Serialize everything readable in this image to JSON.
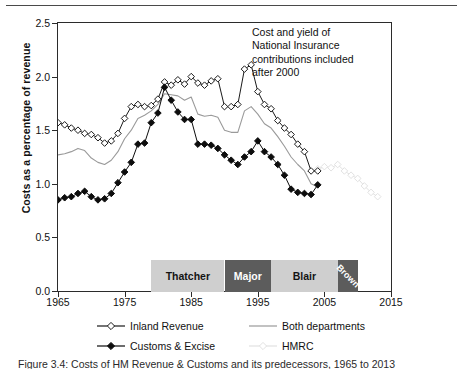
{
  "figure": {
    "caption": "Figure 3.4: Costs of HM Revenue & Customs and its predecessors, 1965 to 2013"
  },
  "annotation": {
    "lines": [
      "Cost and yield of",
      "National Insurance",
      "contributions included",
      "after 2000"
    ]
  },
  "pm_bar": {
    "segments": [
      {
        "name": "Thatcher",
        "start": 1979,
        "end": 1990,
        "style": "light"
      },
      {
        "name": "Major",
        "start": 1990,
        "end": 1997,
        "style": "dark"
      },
      {
        "name": "Blair",
        "start": 1997,
        "end": 2007,
        "style": "light"
      },
      {
        "name": "Brown",
        "start": 2007,
        "end": 2010,
        "style": "dark"
      }
    ]
  },
  "legend": {
    "entries": [
      {
        "label": "Inland Revenue",
        "marker": "open-diamond",
        "color": "#1a1a1a",
        "line": "solid"
      },
      {
        "label": "Both departments",
        "marker": "none",
        "color": "#9a9a9a",
        "line": "solid"
      },
      {
        "label": "Customs & Excise",
        "marker": "filled-diamond",
        "color": "#0d0d0d",
        "line": "solid"
      },
      {
        "label": "HMRC",
        "marker": "open-diamond",
        "color": "#e2e2e2",
        "line": "solid"
      }
    ]
  },
  "chart_data": {
    "type": "line",
    "title": "",
    "xlabel": "",
    "ylabel": "Costs as a percentage of revenue",
    "xlim": [
      1965,
      2015
    ],
    "ylim": [
      0.0,
      2.5
    ],
    "xticks": [
      1965,
      1975,
      1985,
      1995,
      2005,
      2015
    ],
    "yticks": [
      0.0,
      0.5,
      1.0,
      1.5,
      2.0,
      2.5
    ],
    "grid": false,
    "legend_position": "below",
    "series": [
      {
        "name": "Inland Revenue",
        "color": "#1a1a1a",
        "marker": "open-diamond",
        "x": [
          1965,
          1966,
          1967,
          1968,
          1969,
          1970,
          1971,
          1972,
          1973,
          1974,
          1975,
          1976,
          1977,
          1978,
          1979,
          1980,
          1981,
          1982,
          1983,
          1984,
          1985,
          1986,
          1987,
          1988,
          1989,
          1990,
          1991,
          1992,
          1993,
          1994,
          1995,
          1996,
          1997,
          1998,
          1999,
          2000,
          2001,
          2002,
          2003,
          2004
        ],
        "y": [
          1.57,
          1.55,
          1.52,
          1.5,
          1.47,
          1.46,
          1.43,
          1.38,
          1.4,
          1.47,
          1.61,
          1.72,
          1.74,
          1.72,
          1.73,
          1.79,
          1.95,
          1.92,
          1.97,
          1.93,
          2.0,
          1.94,
          1.92,
          1.96,
          1.98,
          1.72,
          1.72,
          1.74,
          2.07,
          2.11,
          1.86,
          1.74,
          1.7,
          1.59,
          1.52,
          1.46,
          1.37,
          1.3,
          1.12,
          1.12
        ]
      },
      {
        "name": "Customs & Excise",
        "color": "#0d0d0d",
        "marker": "filled-diamond",
        "x": [
          1965,
          1966,
          1967,
          1968,
          1969,
          1970,
          1971,
          1972,
          1973,
          1974,
          1975,
          1976,
          1977,
          1978,
          1979,
          1980,
          1981,
          1982,
          1983,
          1984,
          1985,
          1986,
          1987,
          1988,
          1989,
          1990,
          1991,
          1992,
          1993,
          1994,
          1995,
          1996,
          1997,
          1998,
          1999,
          2000,
          2001,
          2002,
          2003,
          2004
        ],
        "y": [
          0.85,
          0.87,
          0.88,
          0.91,
          0.93,
          0.88,
          0.85,
          0.86,
          0.91,
          1.01,
          1.11,
          1.2,
          1.37,
          1.38,
          1.57,
          1.66,
          1.9,
          1.78,
          1.67,
          1.6,
          1.6,
          1.37,
          1.37,
          1.36,
          1.33,
          1.27,
          1.22,
          1.18,
          1.25,
          1.3,
          1.4,
          1.3,
          1.25,
          1.18,
          1.08,
          0.95,
          0.92,
          0.91,
          0.9,
          0.99
        ]
      },
      {
        "name": "Both departments",
        "color": "#9a9a9a",
        "marker": "none",
        "x": [
          1965,
          1966,
          1967,
          1968,
          1969,
          1970,
          1971,
          1972,
          1973,
          1974,
          1975,
          1976,
          1977,
          1978,
          1979,
          1980,
          1981,
          1982,
          1983,
          1984,
          1985,
          1986,
          1987,
          1988,
          1989,
          1990,
          1991,
          1992,
          1993,
          1994,
          1995,
          1996,
          1997,
          1998,
          1999,
          2000,
          2001,
          2002,
          2003,
          2004
        ],
        "y": [
          1.27,
          1.28,
          1.3,
          1.33,
          1.31,
          1.24,
          1.2,
          1.18,
          1.22,
          1.3,
          1.42,
          1.5,
          1.61,
          1.64,
          1.68,
          1.74,
          1.84,
          1.83,
          1.82,
          1.78,
          1.81,
          1.65,
          1.63,
          1.64,
          1.62,
          1.5,
          1.48,
          1.48,
          1.68,
          1.72,
          1.65,
          1.56,
          1.52,
          1.44,
          1.35,
          1.25,
          1.18,
          1.12,
          1.0,
          0.97
        ]
      },
      {
        "name": "HMRC",
        "color": "#e2e2e2",
        "marker": "open-diamond",
        "x": [
          2004,
          2005,
          2006,
          2007,
          2008,
          2009,
          2010,
          2011,
          2012,
          2013
        ],
        "y": [
          1.14,
          1.16,
          1.15,
          1.18,
          1.12,
          1.08,
          1.05,
          0.98,
          0.92,
          0.88
        ]
      }
    ]
  }
}
